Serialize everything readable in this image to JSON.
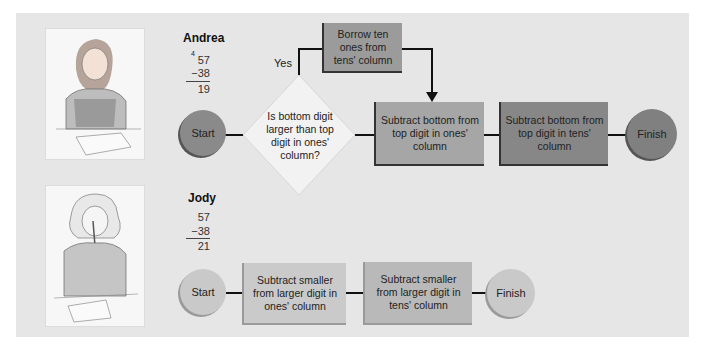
{
  "andrea": {
    "name": "Andrea",
    "problem": {
      "borrow_mark": "4",
      "top": "57",
      "bottom": "−38",
      "answer": "19"
    },
    "flow": {
      "start": "Start",
      "decision": "Is bottom digit larger than top digit in ones' column?",
      "yes_label": "Yes",
      "borrow": "Borrow ten ones from tens' column",
      "ones_step": "Subtract bottom from top digit in ones' column",
      "tens_step": "Subtract bottom from top digit in tens' column",
      "finish": "Finish"
    }
  },
  "jody": {
    "name": "Jody",
    "problem": {
      "top": "57",
      "bottom": "−38",
      "answer": "21"
    },
    "flow": {
      "start": "Start",
      "ones_step": "Subtract smaller from larger digit in ones' column",
      "tens_step": "Subtract smaller from larger digit in tens' column",
      "finish": "Finish"
    }
  },
  "images": {
    "andrea": "girl-writing-illustration",
    "jody": "girl-with-pencil-illustration"
  },
  "colors": {
    "panel": "#e6e6e6",
    "andrea_start": "#8a8a8a",
    "andrea_ones": "#a6a6a6",
    "andrea_tens": "#878787",
    "andrea_finish": "#808080",
    "borrow": "#9b9b9b",
    "decision": "#f2f2f2",
    "jody_start": "#c9c9c9",
    "jody_ones": "#cacaca",
    "jody_tens": "#b9b9b9",
    "jody_finish": "#c9c9c9"
  }
}
